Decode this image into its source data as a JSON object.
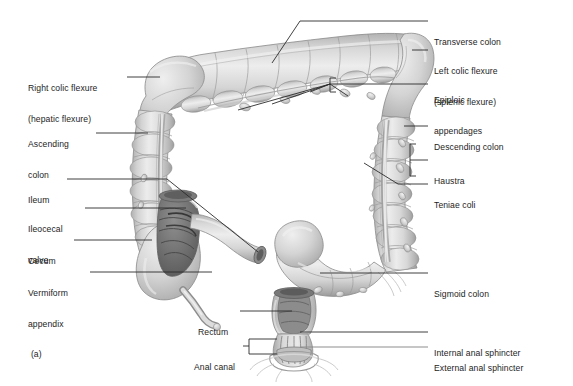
{
  "figure": {
    "panel_letter": "(a)",
    "illustration_style": "grayscale-airbrush-anatomical-drawing",
    "background_color": "#ffffff",
    "text_color": "#1d1d1d",
    "leader_line_color": "#2b2b2b",
    "leader_line_color_light": "#8d8d8d",
    "organ_fill_light": "#e4e4e4",
    "organ_fill_mid": "#c9c9c9",
    "organ_fill_dark": "#a8a8a8",
    "lumen_dark": "#6f6f6f"
  },
  "labels_left": [
    {
      "id": "right-colic-flexure",
      "line1": "Right colic flexure",
      "line2": "(hepatic flexure)"
    },
    {
      "id": "ascending-colon",
      "line1": "Ascending",
      "line2": "colon"
    },
    {
      "id": "ileum",
      "line1": "Ileum",
      "line2": ""
    },
    {
      "id": "ileocecal-valve",
      "line1": "Ileocecal",
      "line2": "valve"
    },
    {
      "id": "cecum",
      "line1": "Cecum",
      "line2": ""
    },
    {
      "id": "vermiform-appendix",
      "line1": "Vermiform",
      "line2": "appendix"
    },
    {
      "id": "rectum",
      "line1": "Rectum",
      "line2": ""
    },
    {
      "id": "anal-canal",
      "line1": "Anal canal",
      "line2": ""
    }
  ],
  "labels_right": [
    {
      "id": "transverse-colon",
      "line1": "Transverse colon",
      "line2": ""
    },
    {
      "id": "left-colic-flexure",
      "line1": "Left colic flexure",
      "line2": "(splenic flexure)"
    },
    {
      "id": "epiploic-appendages",
      "line1": "Epiploic",
      "line2": "appendages"
    },
    {
      "id": "descending-colon",
      "line1": "Descending colon",
      "line2": ""
    },
    {
      "id": "haustra",
      "line1": "Haustra",
      "line2": ""
    },
    {
      "id": "teniae-coli",
      "line1": "Teniae coli",
      "line2": ""
    },
    {
      "id": "sigmoid-colon",
      "line1": "Sigmoid colon",
      "line2": ""
    },
    {
      "id": "internal-anal-sphincter",
      "line1": "Internal anal sphincter",
      "line2": ""
    },
    {
      "id": "external-anal-sphincter",
      "line1": "External anal sphincter",
      "line2": ""
    }
  ]
}
